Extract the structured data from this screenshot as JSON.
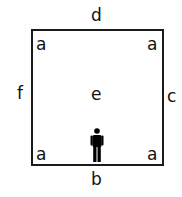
{
  "diagram": {
    "type": "room-floor-plan",
    "walls": {
      "top": "d",
      "bottom": "b",
      "left": "f",
      "right": "c"
    },
    "center": "e",
    "corners": {
      "top_left": "a",
      "top_right": "a",
      "bottom_left": "a",
      "bottom_right": "a"
    },
    "figure": {
      "icon": "person-icon",
      "position": "bottom-center, facing into room",
      "color": "#000000"
    },
    "colors": {
      "line": "#1a1a1a",
      "text": "#111111",
      "background": "#ffffff"
    }
  }
}
